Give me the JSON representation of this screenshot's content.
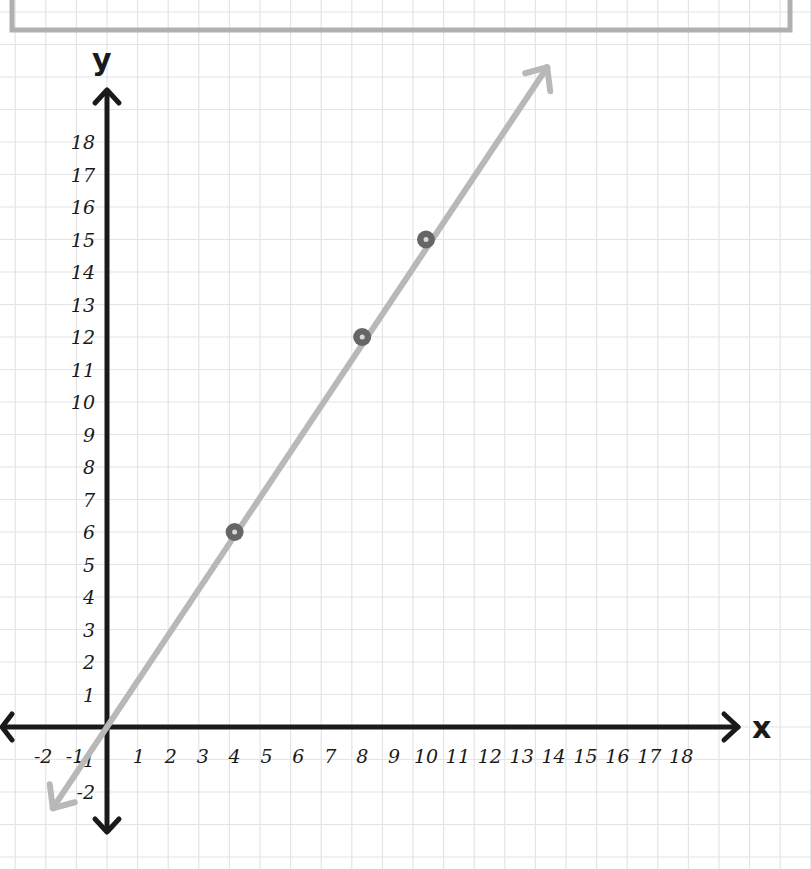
{
  "chart_data": {
    "type": "line",
    "title": "",
    "xlabel": "x",
    "ylabel": "y",
    "xlim": [
      -3,
      20
    ],
    "ylim": [
      -3,
      20
    ],
    "grid": true,
    "x_ticks": [
      "-2",
      "-1",
      "1",
      "2",
      "3",
      "4",
      "5",
      "6",
      "7",
      "8",
      "9",
      "10",
      "11",
      "12",
      "13",
      "14",
      "15",
      "16",
      "17",
      "18"
    ],
    "y_ticks": [
      "-2",
      "-1",
      "1",
      "2",
      "3",
      "4",
      "5",
      "6",
      "7",
      "8",
      "9",
      "10",
      "11",
      "12",
      "13",
      "14",
      "15",
      "16",
      "17",
      "18"
    ],
    "series": [
      {
        "name": "line y = 1.5x",
        "type": "line",
        "x": [
          -1.7,
          13.8
        ],
        "y": [
          -2.5,
          20.3
        ],
        "color": "#b8b8b8",
        "arrows_both_ends": true
      },
      {
        "name": "points",
        "type": "scatter",
        "x": [
          4,
          8,
          10
        ],
        "y": [
          6,
          12,
          15
        ],
        "color": "#6a6a6a"
      }
    ]
  },
  "colors": {
    "axis": "#1a1a1a",
    "grid": "#e4e4e4",
    "line": "#b8b8b8",
    "point": "#666666",
    "frame": "#b0b0b0"
  }
}
